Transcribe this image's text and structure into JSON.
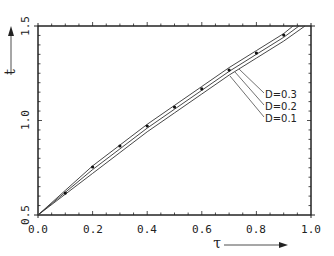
{
  "chart_data": {
    "type": "line",
    "title": "",
    "xlabel": "τ",
    "ylabel": "t",
    "xlim": [
      0.0,
      1.0
    ],
    "ylim": [
      0.5,
      1.5
    ],
    "x_ticks": [
      "0.0",
      "0.2",
      "0.4",
      "0.6",
      "0.8",
      "1.0"
    ],
    "y_ticks": [
      "0.5",
      "1.0",
      "1.5"
    ],
    "grid": false,
    "legend_position": "inline leader-line labels right of curves",
    "series": [
      {
        "name": "D=0.3",
        "x": [
          0.0,
          0.1,
          0.2,
          0.3,
          0.4,
          0.5,
          0.6,
          0.7,
          0.8,
          0.9,
          0.934
        ],
        "values": [
          0.5,
          0.63,
          0.76,
          0.87,
          0.98,
          1.08,
          1.18,
          1.28,
          1.37,
          1.46,
          1.5
        ]
      },
      {
        "name": "D=0.2",
        "x": [
          0.0,
          0.1,
          0.2,
          0.3,
          0.4,
          0.5,
          0.6,
          0.7,
          0.8,
          0.9,
          0.956
        ],
        "values": [
          0.5,
          0.62,
          0.74,
          0.85,
          0.96,
          1.06,
          1.16,
          1.26,
          1.35,
          1.44,
          1.5
        ]
      },
      {
        "name": "D=0.1",
        "x": [
          0.0,
          0.1,
          0.2,
          0.3,
          0.4,
          0.5,
          0.6,
          0.7,
          0.8,
          0.9,
          0.978
        ],
        "values": [
          0.5,
          0.61,
          0.72,
          0.83,
          0.94,
          1.04,
          1.14,
          1.24,
          1.33,
          1.42,
          1.5
        ]
      }
    ],
    "markers": {
      "x": [
        0.1,
        0.2,
        0.3,
        0.4,
        0.5,
        0.6,
        0.7,
        0.8,
        0.9
      ],
      "values": [
        0.616,
        0.754,
        0.865,
        0.971,
        1.071,
        1.167,
        1.267,
        1.357,
        1.452
      ]
    }
  },
  "labels": {
    "x_title": "τ",
    "y_title": "t",
    "d03": "D=0.3",
    "d02": "D=0.2",
    "d01": "D=0.1",
    "x0": "0.0",
    "x1": "0.2",
    "x2": "0.4",
    "x3": "0.6",
    "x4": "0.8",
    "x5": "1.0",
    "y0": "0.5",
    "y1": "1.0",
    "y2": "1.5"
  }
}
